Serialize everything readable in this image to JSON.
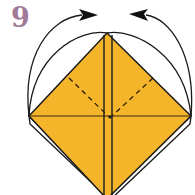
{
  "step": {
    "number": "9",
    "number_color": "#a07a98"
  },
  "colors": {
    "paper": "#f5b52a",
    "line": "#1a1a1a",
    "background": "#ffffff"
  },
  "elements": {
    "arrows": [
      {
        "name": "left-fold-arrow",
        "direction": "right"
      },
      {
        "name": "right-fold-arrow",
        "direction": "left"
      }
    ],
    "fold_lines": [
      "vertical-center-strip",
      "horizontal-center-crease",
      "left-dashed-valley-fold",
      "right-dashed-valley-fold"
    ]
  }
}
